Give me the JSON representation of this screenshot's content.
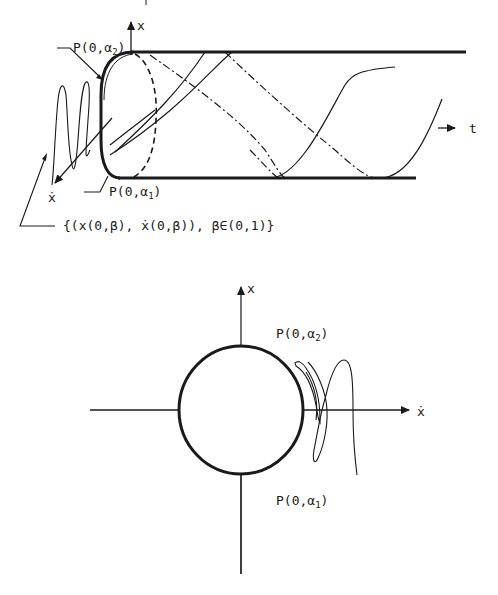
{
  "top_diagram": {
    "axis_x_label": "x",
    "axis_t_label": "t",
    "label_p_alpha2": {
      "prefix": "P(0,α",
      "sub": "2",
      "suffix": ")"
    },
    "label_p_alpha1": {
      "prefix": "P(0,α",
      "sub": "1",
      "suffix": ")"
    },
    "label_xdot": "ẋ",
    "set_label": "{(x(0,β), ẋ(0,β)), β∈(0,1)}"
  },
  "bottom_diagram": {
    "axis_x_label": "x",
    "axis_xdot_label": "ẋ",
    "label_p_alpha2": {
      "prefix": "P(0,α",
      "sub": "2",
      "suffix": ")"
    },
    "label_p_alpha1": {
      "prefix": "P(0,α",
      "sub": "1",
      "suffix": ")"
    }
  },
  "colors": {
    "ink": "#1a1a1a",
    "background": "#ffffff"
  }
}
